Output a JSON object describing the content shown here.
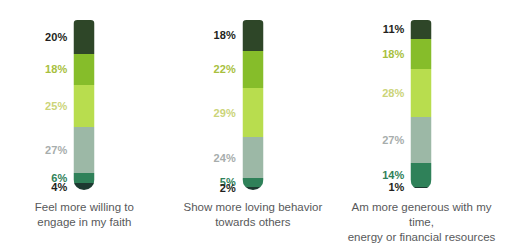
{
  "chart_data": {
    "type": "bar",
    "title": "",
    "xlabel": "",
    "ylabel": "",
    "ylim": [
      0,
      100
    ],
    "grid": false,
    "legend": "none",
    "stacked": true,
    "orientation": "vertical",
    "categories": [
      "Feel more willing to engage in my faith",
      "Show more loving behavior towards others",
      "Am more generous with my time, energy or financial resources"
    ],
    "series": [
      {
        "name": "segment-1-top",
        "values": [
          20,
          18,
          11
        ]
      },
      {
        "name": "segment-2",
        "values": [
          18,
          22,
          18
        ]
      },
      {
        "name": "segment-3",
        "values": [
          25,
          29,
          28
        ]
      },
      {
        "name": "segment-4",
        "values": [
          27,
          24,
          27
        ]
      },
      {
        "name": "segment-5",
        "values": [
          6,
          5,
          14
        ]
      },
      {
        "name": "segment-6-bottom",
        "values": [
          4,
          2,
          1
        ]
      }
    ],
    "segment_colors": [
      "#2e4628",
      "#86bd2a",
      "#b8dd4e",
      "#9cb8a6",
      "#2f8159",
      "#1d3a31"
    ],
    "label_colors": [
      "#231f20",
      "#a8bf3e",
      "#cbd478",
      "#a7adac",
      "#2f8159",
      "#231f20"
    ]
  },
  "columns": [
    {
      "caption_line1": "Feel more willing to",
      "caption_line2": "engage in my faith",
      "segments": [
        {
          "label": "20%",
          "value": 20,
          "color": "#2e4628",
          "label_color": "#231f20"
        },
        {
          "label": "18%",
          "value": 18,
          "color": "#86bd2a",
          "label_color": "#a8bf3e"
        },
        {
          "label": "25%",
          "value": 25,
          "color": "#b8dd4e",
          "label_color": "#cbd478"
        },
        {
          "label": "27%",
          "value": 27,
          "color": "#9cb8a6",
          "label_color": "#a7adac"
        },
        {
          "label": "6%",
          "value": 6,
          "color": "#2f8159",
          "label_color": "#2f8159"
        },
        {
          "label": "4%",
          "value": 4,
          "color": "#1d3a31",
          "label_color": "#231f20"
        }
      ]
    },
    {
      "caption_line1": "Show more loving behavior",
      "caption_line2": "towards others",
      "segments": [
        {
          "label": "18%",
          "value": 18,
          "color": "#2e4628",
          "label_color": "#231f20"
        },
        {
          "label": "22%",
          "value": 22,
          "color": "#86bd2a",
          "label_color": "#a8bf3e"
        },
        {
          "label": "29%",
          "value": 29,
          "color": "#b8dd4e",
          "label_color": "#cbd478"
        },
        {
          "label": "24%",
          "value": 24,
          "color": "#9cb8a6",
          "label_color": "#a7adac"
        },
        {
          "label": "5%",
          "value": 5,
          "color": "#2f8159",
          "label_color": "#2f8159"
        },
        {
          "label": "2%",
          "value": 2,
          "color": "#1d3a31",
          "label_color": "#231f20"
        }
      ]
    },
    {
      "caption_line1": "Am more generous with my time,",
      "caption_line2": "energy or financial resources",
      "segments": [
        {
          "label": "11%",
          "value": 11,
          "color": "#2e4628",
          "label_color": "#231f20"
        },
        {
          "label": "18%",
          "value": 18,
          "color": "#86bd2a",
          "label_color": "#a8bf3e"
        },
        {
          "label": "28%",
          "value": 28,
          "color": "#b8dd4e",
          "label_color": "#cbd478"
        },
        {
          "label": "27%",
          "value": 27,
          "color": "#9cb8a6",
          "label_color": "#a7adac"
        },
        {
          "label": "14%",
          "value": 14,
          "color": "#2f8159",
          "label_color": "#2f8159"
        },
        {
          "label": "1%",
          "value": 1,
          "color": "#1d3a31",
          "label_color": "#231f20"
        }
      ]
    }
  ]
}
